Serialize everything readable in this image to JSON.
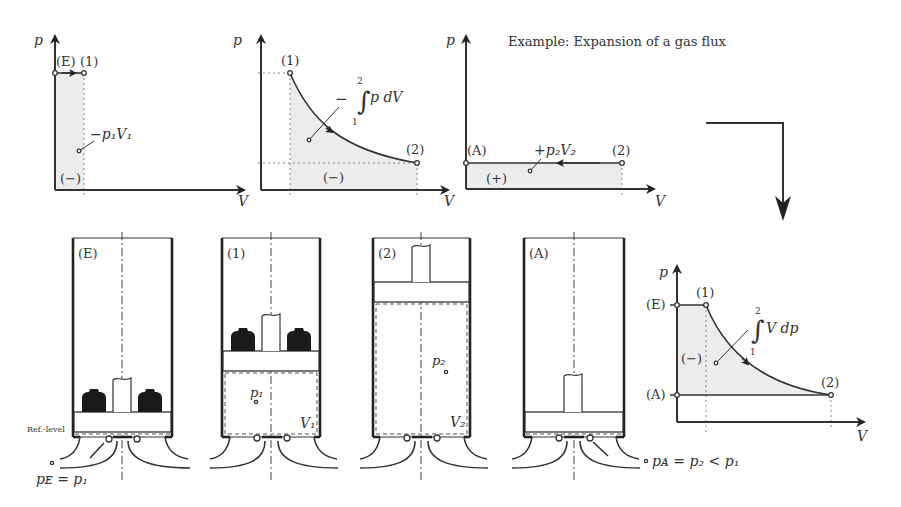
{
  "title": "Example: Expansion of a gas flux",
  "axes": {
    "p": "p",
    "V": "V"
  },
  "graph_E_1": {
    "points": [
      "(E)",
      "(1)"
    ],
    "area_label": "−p₁V₁",
    "sign": "(−)"
  },
  "graph_1_2": {
    "points": [
      "(1)",
      "(2)"
    ],
    "integral_prefix": "−",
    "integral_upper": "2",
    "integral_lower": "1",
    "integrand": "p dV",
    "sign": "(−)"
  },
  "graph_2_A": {
    "points": [
      "(A)",
      "(2)"
    ],
    "area_label": "+p₂V₂",
    "sign": "(+)"
  },
  "graph_total": {
    "levels": [
      "(E)",
      "(A)"
    ],
    "points": [
      "(1)",
      "(2)"
    ],
    "integral_upper": "2",
    "integral_lower": "1",
    "integrand": "V dp",
    "sign": "(−)"
  },
  "cylinders": [
    {
      "state": "(E)"
    },
    {
      "state": "(1)",
      "pressure": "p₁",
      "volume": "V₁"
    },
    {
      "state": "(2)",
      "pressure": "p₂",
      "volume": "V₂"
    },
    {
      "state": "(A)"
    }
  ],
  "ref_level": "Ref.-level",
  "inlet_condition": "pᴇ = p₁",
  "outlet_condition": "pᴀ = p₂ < p₁"
}
